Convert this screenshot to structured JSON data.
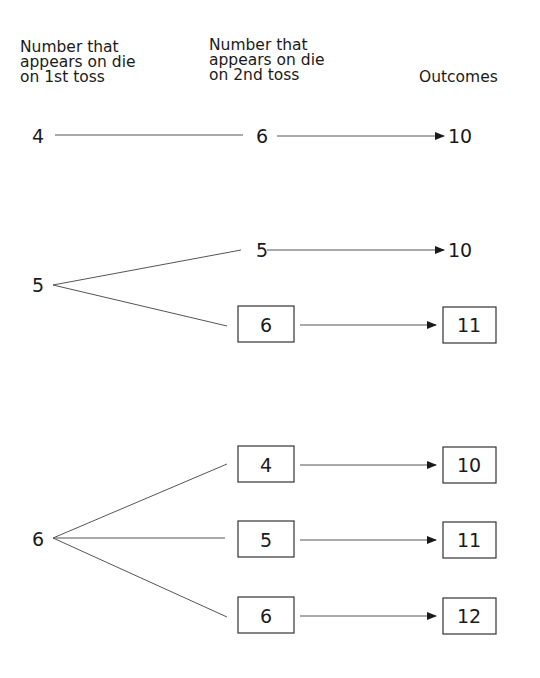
{
  "headers": {
    "first_toss": "Number that\nappears on die\non 1st toss",
    "second_toss": "Number that\nappears on die\non 2nd toss",
    "outcomes": "Outcomes"
  },
  "tree": {
    "branches": [
      {
        "first": "4",
        "children": [
          {
            "second": "6",
            "outcome": "10",
            "boxed": false
          }
        ]
      },
      {
        "first": "5",
        "children": [
          {
            "second": "5",
            "outcome": "10",
            "boxed": false
          },
          {
            "second": "6",
            "outcome": "11",
            "boxed": true
          }
        ]
      },
      {
        "first": "6",
        "children": [
          {
            "second": "4",
            "outcome": "10",
            "boxed": true
          },
          {
            "second": "5",
            "outcome": "11",
            "boxed": true
          },
          {
            "second": "6",
            "outcome": "12",
            "boxed": true
          }
        ]
      }
    ]
  },
  "colors": {
    "line": "#555555",
    "text": "#1a1a1a",
    "box_border": "#333333"
  }
}
